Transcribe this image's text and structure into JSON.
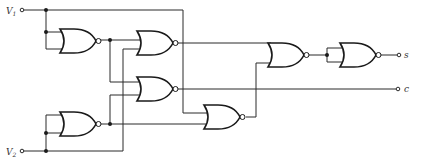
{
  "diagram": {
    "type": "logic-circuit",
    "gate_type": "NOR",
    "inputs": [
      {
        "label": "V",
        "subscript": "1"
      },
      {
        "label": "V",
        "subscript": "2"
      }
    ],
    "outputs": [
      {
        "label": "S"
      },
      {
        "label": "C"
      }
    ],
    "gate_count": 7
  }
}
